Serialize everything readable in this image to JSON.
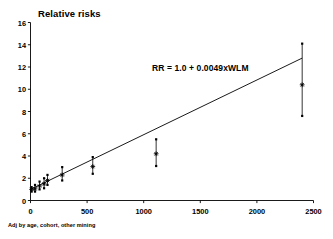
{
  "chart_data": {
    "type": "scatter",
    "title": "Relative risks",
    "xlabel": "",
    "ylabel": "",
    "xlim": [
      0,
      2500
    ],
    "ylim": [
      0,
      16
    ],
    "xticks": [
      0,
      500,
      1000,
      1500,
      2000,
      2500
    ],
    "yticks": [
      0,
      2,
      4,
      6,
      8,
      10,
      12,
      14,
      16
    ],
    "grid": false,
    "legend": null,
    "footnote": "Adj by age, cohort, other mining",
    "annotations": [
      {
        "text": "RR = 1.0 + 0.0049xWLM",
        "x": 1100,
        "y": 12.1
      }
    ],
    "fit_line": {
      "label": "RR = 1.0 + 0.0049xWLM",
      "intercept": 1.0,
      "slope": 0.0049,
      "x_start": 0,
      "x_end": 2400,
      "y_start": 1.0,
      "y_end": 12.8
    },
    "series": [
      {
        "name": "Relative risk by cumulative exposure (WLM)",
        "marker": "asterisk",
        "error_bars": "95% CI",
        "points": [
          {
            "x": 10,
            "y": 1.0,
            "ci_low": 0.8,
            "ci_high": 1.2
          },
          {
            "x": 40,
            "y": 1.05,
            "ci_low": 0.8,
            "ci_high": 1.4
          },
          {
            "x": 80,
            "y": 1.3,
            "ci_low": 1.0,
            "ci_high": 1.7
          },
          {
            "x": 120,
            "y": 1.5,
            "ci_low": 1.1,
            "ci_high": 2.0
          },
          {
            "x": 150,
            "y": 1.8,
            "ci_low": 1.4,
            "ci_high": 2.3
          },
          {
            "x": 280,
            "y": 2.3,
            "ci_low": 1.8,
            "ci_high": 3.0
          },
          {
            "x": 550,
            "y": 3.05,
            "ci_low": 2.4,
            "ci_high": 3.9
          },
          {
            "x": 1110,
            "y": 4.2,
            "ci_low": 3.1,
            "ci_high": 5.5
          },
          {
            "x": 2400,
            "y": 10.4,
            "ci_low": 7.6,
            "ci_high": 14.1
          }
        ]
      }
    ]
  },
  "colors": {
    "axis": "#000000",
    "marker": "#000000",
    "line": "#000000",
    "background": "#ffffff"
  }
}
